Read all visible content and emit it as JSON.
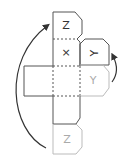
{
  "diagram": {
    "type": "cube-net-folding",
    "colors": {
      "dark_line": "#555555",
      "light_line": "#bbbbbb",
      "dark_text": "#333333",
      "light_text": "#aaaaaa",
      "arrow": "#333333"
    },
    "faces": [
      {
        "id": "top-z",
        "label": "Z",
        "style": "dark"
      },
      {
        "id": "center-x",
        "label": "×",
        "style": "dark"
      },
      {
        "id": "right-y-tab",
        "label": "Y",
        "style": "dark",
        "rotated": true
      },
      {
        "id": "left-square",
        "label": "",
        "style": "dark"
      },
      {
        "id": "center-lower",
        "label": "",
        "style": "dark"
      },
      {
        "id": "right-y-ghost",
        "label": "Y",
        "style": "light"
      },
      {
        "id": "bottom-square",
        "label": "",
        "style": "dark"
      },
      {
        "id": "bottom-z-ghost",
        "label": "Z",
        "style": "light"
      }
    ],
    "arrows": [
      {
        "id": "left-fold-arrow",
        "from": "bottom-z-ghost",
        "to": "top-z"
      },
      {
        "id": "right-fold-arrow",
        "from": "right-y-ghost",
        "to": "right-y-tab"
      }
    ]
  }
}
